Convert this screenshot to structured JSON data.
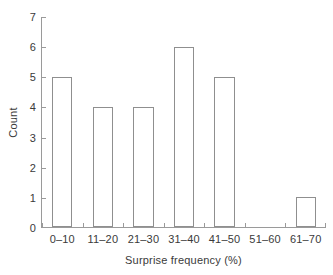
{
  "chart_data": {
    "type": "bar",
    "title": "",
    "subtitle": "",
    "xlabel": "Surprise frequency (%)",
    "ylabel": "Count",
    "categories": [
      "0–10",
      "11–20",
      "21–30",
      "31–40",
      "41–50",
      "51–60",
      "61–70"
    ],
    "values": [
      5,
      4,
      4,
      6,
      5,
      0,
      1
    ],
    "ylim": [
      0,
      7
    ],
    "ytick_labels": [
      "0",
      "1",
      "2",
      "3",
      "4",
      "5",
      "6",
      "7"
    ],
    "ytick_values": [
      0,
      1,
      2,
      3,
      4,
      5,
      6,
      7
    ],
    "grid": false,
    "legend": null,
    "annotations": [],
    "style": {
      "bar_fill": "#ffffff",
      "bar_stroke": "#8f8f8f",
      "axis_color": "#9a9a9a",
      "text_color": "#3a3a3a",
      "background": "#ffffff"
    }
  }
}
